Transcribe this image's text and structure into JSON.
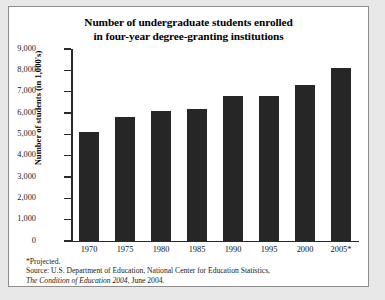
{
  "chart_data": {
    "type": "bar",
    "title": "Number of undergraduate students enrolled in four-year degree-granting institutions",
    "title_line1": "Number of undergraduate students enrolled",
    "title_line2": "in four-year degree-granting institutions",
    "xlabel": "",
    "ylabel": "Number of students (in 1,000's)",
    "categories": [
      "1970",
      "1975",
      "1980",
      "1985",
      "1990",
      "1995",
      "2000",
      "2005*"
    ],
    "values": [
      5100,
      5800,
      6100,
      6200,
      6800,
      6800,
      7300,
      8100
    ],
    "ylim": [
      0,
      9000
    ],
    "ytick_values": [
      9000,
      8000,
      7000,
      6000,
      5000,
      4000,
      3000,
      2000,
      1000,
      0
    ],
    "ytick_labels": [
      "9,000",
      "8,000",
      "7,000",
      "6,000",
      "5,000",
      "4,000",
      "3,000",
      "2,000",
      "1,000",
      "0"
    ],
    "grid": false,
    "legend": null,
    "bar_color": "#262626",
    "axis_color": "#2b2b2b"
  },
  "footnotes": {
    "projected": "*Projected.",
    "source_line1": "Source: U.S. Department of Education, National Center for Education Statistics,",
    "source_line2_italic": "The Condition of Education 2004",
    "source_line2_rest": ", June 2004."
  },
  "colors": {
    "page_background": "#e8e8e8",
    "panel_background": "#ffffff",
    "panel_border": "#8d8d8d"
  }
}
